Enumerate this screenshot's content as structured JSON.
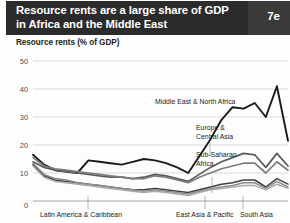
{
  "header": {
    "title": "Resource rents are a large share of GDP in Africa and the Middle East",
    "badge": "7e"
  },
  "subtitle": "Resource rents (% of GDP)",
  "chart_data": {
    "type": "line",
    "title": "Resource rents are a large share of GDP in Africa and the Middle East",
    "subtitle": "Resource rents (% of GDP)",
    "xlabel": "",
    "ylabel": "Resource rents (% of GDP)",
    "ylim": [
      0,
      50
    ],
    "yticks": [
      0,
      10,
      20,
      30,
      40,
      50
    ],
    "grid": true,
    "legend": "inline-annotations",
    "x": [
      0,
      1,
      2,
      3,
      4,
      5,
      6,
      7,
      8,
      9,
      10,
      11,
      12,
      13,
      14,
      15,
      16,
      17,
      18,
      19,
      20,
      21,
      22,
      23
    ],
    "series": [
      {
        "name": "Middle East & North Africa",
        "color": "#1a1a1a",
        "label_x": 155,
        "label_y": 104,
        "values": [
          16.5,
          13.0,
          11.0,
          10.5,
          10.0,
          14.5,
          14.0,
          13.5,
          13.0,
          14.0,
          15.0,
          14.5,
          13.5,
          12.0,
          10.0,
          16.0,
          22.0,
          29.0,
          33.5,
          33.0,
          35.0,
          30.0,
          41.0,
          21.5
        ]
      },
      {
        "name": "Europe & Central Asia",
        "color": "#5a5a5a",
        "label_x": 196,
        "label_y": 133,
        "values": [
          14.0,
          12.0,
          11.0,
          10.5,
          10.0,
          9.5,
          9.0,
          8.5,
          8.5,
          8.0,
          8.5,
          9.5,
          9.0,
          8.0,
          7.0,
          9.5,
          12.0,
          14.0,
          15.5,
          17.0,
          16.5,
          12.0,
          17.0,
          12.5
        ]
      },
      {
        "name": "Sub-Saharan Africa",
        "color": "#7d7d7d",
        "label_x": 196,
        "label_y": 160,
        "values": [
          15.5,
          12.5,
          11.5,
          11.0,
          10.5,
          10.0,
          9.5,
          9.0,
          8.5,
          8.0,
          8.0,
          9.0,
          8.5,
          7.5,
          6.5,
          8.5,
          10.0,
          11.5,
          12.5,
          13.5,
          13.5,
          10.0,
          14.0,
          11.0
        ]
      },
      {
        "name": "East Asia & Pacific",
        "color": "#3f3f3f",
        "label_x": 186,
        "label_y": 216,
        "values": [
          13.0,
          9.0,
          7.5,
          7.0,
          6.5,
          6.0,
          5.5,
          5.0,
          4.5,
          4.0,
          4.0,
          4.5,
          4.0,
          3.5,
          3.0,
          4.0,
          5.0,
          6.0,
          6.5,
          7.5,
          7.5,
          5.0,
          8.0,
          6.0
        ]
      },
      {
        "name": "Latin America & Caribbean",
        "color": "#8c8c8c",
        "label_x": 40,
        "label_y": 216,
        "values": [
          13.5,
          9.5,
          8.0,
          7.5,
          6.5,
          6.0,
          5.5,
          5.0,
          4.5,
          4.0,
          3.5,
          4.0,
          3.5,
          3.0,
          2.5,
          3.5,
          4.5,
          5.0,
          5.5,
          6.5,
          6.5,
          4.5,
          7.0,
          5.0
        ]
      },
      {
        "name": "South Asia",
        "color": "#a8a8a8",
        "label_x": 243,
        "label_y": 216,
        "values": [
          12.5,
          8.5,
          7.0,
          6.5,
          6.0,
          5.5,
          5.0,
          4.5,
          4.0,
          3.5,
          3.0,
          3.5,
          3.0,
          2.5,
          2.0,
          3.0,
          4.0,
          4.5,
          5.0,
          5.5,
          5.5,
          4.0,
          6.0,
          4.5
        ]
      }
    ],
    "annotations": [
      {
        "text": "Middle East & North Africa",
        "x": 155,
        "y": 104
      },
      {
        "text": "Europe &",
        "x": 196,
        "y": 130
      },
      {
        "text": "Central Asia",
        "x": 196,
        "y": 139
      },
      {
        "text": "Sub-Saharan",
        "x": 196,
        "y": 157
      },
      {
        "text": "Africa",
        "x": 196,
        "y": 166
      },
      {
        "text": "Latin America & Caribbean",
        "x": 40,
        "y": 217
      },
      {
        "text": "East Asia & Pacific",
        "x": 176,
        "y": 217
      },
      {
        "text": "South Asia",
        "x": 240,
        "y": 217
      }
    ]
  }
}
